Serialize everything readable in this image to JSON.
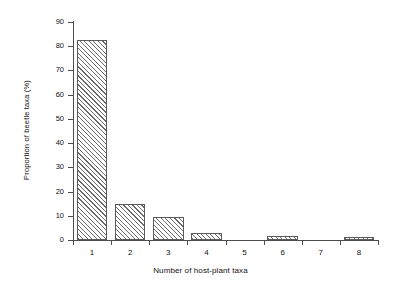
{
  "chart_data": {
    "type": "bar",
    "title": "",
    "xlabel": "Number of host-plant taxa",
    "ylabel": "Proportion of beetle taxa (%)",
    "categories": [
      "1",
      "2",
      "3",
      "4",
      "5",
      "6",
      "7",
      "8"
    ],
    "values": [
      82.5,
      14.8,
      9.7,
      2.8,
      0,
      1.5,
      0,
      1.4
    ],
    "ylim": [
      0,
      90
    ],
    "xlim": [
      0.5,
      8.5
    ],
    "yticks": [
      0,
      10,
      20,
      30,
      40,
      50,
      60,
      70,
      80,
      90
    ],
    "ytick_labels": [
      "0",
      "10",
      "20",
      "30",
      "40",
      "50",
      "60",
      "70",
      "80",
      "90"
    ],
    "xtick_labels": [
      "1",
      "2",
      "3",
      "4",
      "5",
      "6",
      "7",
      "8"
    ],
    "grid": false,
    "legend": null,
    "bar_style": "diagonal-hatch",
    "colors": {
      "bar_edge": "#5a5a5a",
      "bar_hatch": "#6b6b6b",
      "bar_fill": "#ffffff",
      "axis": "#4d4d4d",
      "text": "#111111",
      "background": "#ffffff"
    }
  }
}
